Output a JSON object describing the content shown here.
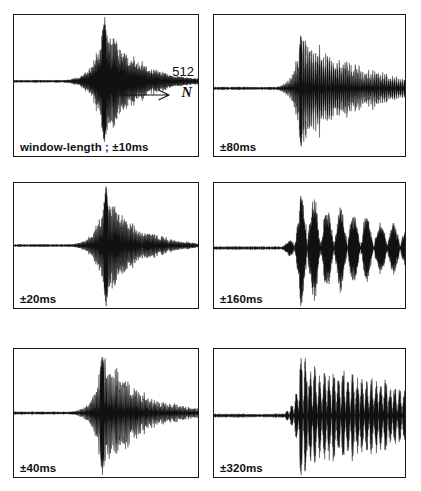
{
  "figure": {
    "type": "waveform-panel-grid",
    "background_color": "#ffffff",
    "ink_color": "#111111",
    "border_color": "#1a1a1a",
    "columns": 2,
    "rows": 3
  },
  "annotations": {
    "sample_count": "512",
    "axis_letter": "N",
    "arrow_icon": "right-arrow-icon"
  },
  "panels": [
    {
      "id": "panel-10ms",
      "label": "window-length ; ±10ms",
      "window_ms": 10,
      "position": {
        "row": 0,
        "col": 0,
        "x": 13,
        "y": 14,
        "w": 186,
        "h": 143
      },
      "baseline_frac": 0.47,
      "burst_center_frac": 0.49,
      "burst_width_frac": 0.13,
      "spike_height_frac": 0.44,
      "tail_decay": 0.055,
      "tail_extent_frac": 0.55,
      "carrier_density": 2.3,
      "noise_floor": 0.012,
      "has_count_label": true
    },
    {
      "id": "panel-80ms",
      "label": "±80ms",
      "window_ms": 80,
      "position": {
        "row": 0,
        "col": 1,
        "x": 213,
        "y": 14,
        "w": 193,
        "h": 143
      },
      "baseline_frac": 0.52,
      "burst_center_frac": 0.455,
      "burst_width_frac": 0.085,
      "spike_height_frac": 0.4,
      "tail_decay": 0.14,
      "tail_extent_frac": 0.62,
      "carrier_density": 3.1,
      "noise_floor": 0.016,
      "has_count_label": false
    },
    {
      "id": "panel-20ms",
      "label": "±20ms",
      "window_ms": 20,
      "position": {
        "row": 1,
        "col": 0,
        "x": 13,
        "y": 182,
        "w": 186,
        "h": 127
      },
      "baseline_frac": 0.5,
      "burst_center_frac": 0.5,
      "burst_width_frac": 0.115,
      "spike_height_frac": 0.47,
      "tail_decay": 0.075,
      "tail_extent_frac": 0.38,
      "carrier_density": 2.6,
      "noise_floor": 0.013,
      "has_count_label": false
    },
    {
      "id": "panel-160ms",
      "label": "±160ms",
      "window_ms": 160,
      "position": {
        "row": 1,
        "col": 1,
        "x": 213,
        "y": 182,
        "w": 193,
        "h": 127
      },
      "baseline_frac": 0.52,
      "burst_center_frac": 0.455,
      "burst_width_frac": 0.075,
      "spike_height_frac": 0.44,
      "tail_decay": 0.19,
      "tail_extent_frac": 0.9,
      "carrier_density": 3.4,
      "noise_floor": 0.018,
      "has_count_label": false
    },
    {
      "id": "panel-40ms",
      "label": "±40ms",
      "window_ms": 40,
      "position": {
        "row": 2,
        "col": 0,
        "x": 13,
        "y": 348,
        "w": 186,
        "h": 130
      },
      "baseline_frac": 0.5,
      "burst_center_frac": 0.48,
      "burst_width_frac": 0.105,
      "spike_height_frac": 0.46,
      "tail_decay": 0.105,
      "tail_extent_frac": 0.44,
      "carrier_density": 2.9,
      "noise_floor": 0.014,
      "has_count_label": false
    },
    {
      "id": "panel-320ms",
      "label": "±320ms",
      "window_ms": 320,
      "position": {
        "row": 2,
        "col": 1,
        "x": 213,
        "y": 348,
        "w": 193,
        "h": 130
      },
      "baseline_frac": 0.52,
      "burst_center_frac": 0.455,
      "burst_width_frac": 0.07,
      "spike_height_frac": 0.44,
      "tail_decay": 0.24,
      "tail_extent_frac": 0.98,
      "carrier_density": 3.6,
      "noise_floor": 0.02,
      "has_count_label": false
    }
  ],
  "chart_data": {
    "type": "line",
    "title": "",
    "xlabel": "N",
    "ylabel": "",
    "grid": false,
    "legend": null,
    "annotations": [
      "512",
      "N"
    ],
    "panel_labels": [
      "window-length ; ±10ms",
      "±80ms",
      "±20ms",
      "±160ms",
      "±40ms",
      "±320ms"
    ],
    "window_lengths_ms": [
      10,
      80,
      20,
      160,
      40,
      320
    ],
    "series": [
      {
        "name": "window-length ; ±10ms",
        "tail_decay": 0.055,
        "spike_amplitude": 1.0,
        "tail_extent": 0.55
      },
      {
        "name": "±80ms",
        "tail_decay": 0.14,
        "spike_amplitude": 0.91,
        "tail_extent": 0.62
      },
      {
        "name": "±20ms",
        "tail_decay": 0.075,
        "spike_amplitude": 1.0,
        "tail_extent": 0.38
      },
      {
        "name": "±160ms",
        "tail_decay": 0.19,
        "spike_amplitude": 0.94,
        "tail_extent": 0.9
      },
      {
        "name": "±40ms",
        "tail_decay": 0.105,
        "spike_amplitude": 0.98,
        "tail_extent": 0.44
      },
      {
        "name": "±320ms",
        "tail_decay": 0.24,
        "spike_amplitude": 0.94,
        "tail_extent": 0.98
      }
    ],
    "x_samples": 512,
    "xlim": [
      0,
      512
    ]
  }
}
